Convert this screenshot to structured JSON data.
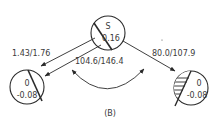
{
  "diagram": {
    "caption": "(B)",
    "nodes": {
      "source": {
        "top": "S",
        "bottom": "0.16",
        "hatched": false
      },
      "left": {
        "top": "0",
        "bottom": "-0.08",
        "hatched": false
      },
      "right": {
        "top": "0",
        "bottom": "-0.08",
        "hatched": true
      }
    },
    "edges": {
      "source_to_left_outer": {
        "label": "1.43/1.76"
      },
      "source_to_left_inner": {
        "label": "104.6/146.4"
      },
      "source_to_right": {
        "label": "80.0/107.9"
      }
    },
    "colors": {
      "stroke": "#2a2a2a",
      "text": "#3a3a3a",
      "background": "#ffffff"
    }
  }
}
